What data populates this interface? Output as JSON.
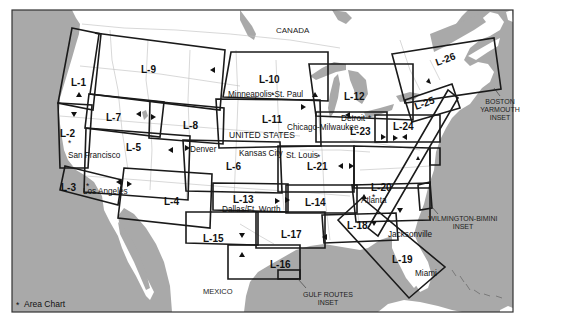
{
  "colors": {
    "water": "#a9a9a9",
    "land": "#ffffff",
    "chart_border": "#1a1a1a",
    "frame": "#333333"
  },
  "countries": {
    "canada": "CANADA",
    "united_states": "UNITED STATES",
    "mexico": "MEXICO"
  },
  "charts": [
    {
      "id": "L-1",
      "label": "L-1"
    },
    {
      "id": "L-2",
      "label": "L-2"
    },
    {
      "id": "L-3",
      "label": "L-3"
    },
    {
      "id": "L-4",
      "label": "L-4"
    },
    {
      "id": "L-5",
      "label": "L-5"
    },
    {
      "id": "L-6",
      "label": "L-6"
    },
    {
      "id": "L-7",
      "label": "L-7"
    },
    {
      "id": "L-8",
      "label": "L-8"
    },
    {
      "id": "L-9",
      "label": "L-9"
    },
    {
      "id": "L-10",
      "label": "L-10"
    },
    {
      "id": "L-11",
      "label": "L-11"
    },
    {
      "id": "L-12",
      "label": "L-12"
    },
    {
      "id": "L-13",
      "label": "L-13"
    },
    {
      "id": "L-14",
      "label": "L-14"
    },
    {
      "id": "L-15",
      "label": "L-15"
    },
    {
      "id": "L-16",
      "label": "L-16"
    },
    {
      "id": "L-17",
      "label": "L-17"
    },
    {
      "id": "L-18",
      "label": "L-18"
    },
    {
      "id": "L-19",
      "label": "L-19"
    },
    {
      "id": "L-20",
      "label": "L-20"
    },
    {
      "id": "L-21",
      "label": "L-21"
    },
    {
      "id": "L-23",
      "label": "L-23"
    },
    {
      "id": "L-24",
      "label": "L-24"
    },
    {
      "id": "L-25",
      "label": "L-25"
    },
    {
      "id": "L-26",
      "label": "L-26"
    }
  ],
  "cities": {
    "san_francisco": "San Francisco",
    "los_angeles": "Los Angeles",
    "denver": "Denver",
    "minneapolis": "Minneapolis-St. Paul",
    "chicago": "Chicago-Milwaukee",
    "detroit": "Detroit",
    "kansas_city": "Kansas City",
    "st_louis": "St. Louis",
    "dallas": "Dallas/Ft. Worth",
    "atlanta": "Atlanta",
    "jacksonville": "Jacksonville",
    "miami": "Miami"
  },
  "insets": {
    "boston": [
      "BOSTON",
      "YARMOUTH",
      "INSET"
    ],
    "wilmington": [
      "WILMINGTON-BIMINI",
      "INSET"
    ],
    "gulf": [
      "GULF ROUTES",
      "INSET"
    ]
  },
  "legend": {
    "symbol": "*",
    "label": "Area Chart"
  }
}
